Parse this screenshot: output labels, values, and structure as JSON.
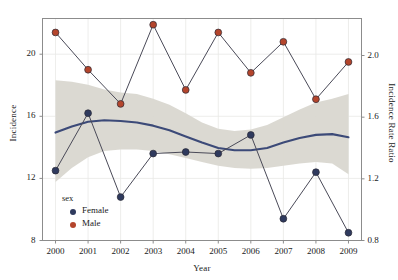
{
  "chart_data": {
    "type": "line",
    "title": "",
    "xlabel": "Year",
    "ylabel": "Incidence",
    "y2label": "Incidence Rate Ratio",
    "x": [
      2000,
      2001,
      2002,
      2003,
      2004,
      2005,
      2006,
      2007,
      2008,
      2009
    ],
    "xtick_labels": [
      "2000",
      "2001",
      "2002",
      "2003",
      "2004",
      "2005",
      "2006",
      "2007",
      "2008",
      "2009"
    ],
    "xlim": [
      1999.6,
      2009.4
    ],
    "ylim": [
      8,
      22.3
    ],
    "ytick_labels": [
      "8",
      "12",
      "16",
      "20"
    ],
    "yticks": [
      8,
      12,
      16,
      20
    ],
    "y2lim": [
      0.8,
      2.24
    ],
    "y2tick_labels": [
      "0.8",
      "1.2",
      "1.6",
      "2.0"
    ],
    "y2ticks": [
      0.8,
      1.2,
      1.6,
      2.0
    ],
    "grid": true,
    "legend_title": "sex",
    "legend_position": "inside-bottom-left",
    "series": [
      {
        "name": "Female",
        "color": "#2f3a5e",
        "axis": "left",
        "values": [
          12.5,
          16.2,
          10.8,
          13.6,
          13.7,
          13.6,
          14.8,
          9.4,
          12.4,
          8.5
        ]
      },
      {
        "name": "Male",
        "color": "#b4452c",
        "axis": "left",
        "values": [
          21.4,
          19.0,
          16.8,
          21.9,
          17.7,
          21.4,
          18.8,
          20.8,
          17.1,
          19.5
        ]
      }
    ],
    "trend": {
      "name": "Incidence Rate Ratio",
      "color": "#3c4a78",
      "axis": "right",
      "band_color": "#d9d7d0",
      "x": [
        2000,
        2000.5,
        2001,
        2001.5,
        2002,
        2002.5,
        2003,
        2003.5,
        2004,
        2004.5,
        2005,
        2005.5,
        2006,
        2006.5,
        2007,
        2007.5,
        2008,
        2008.5,
        2009
      ],
      "fit": [
        1.5,
        1.54,
        1.57,
        1.58,
        1.575,
        1.565,
        1.545,
        1.515,
        1.475,
        1.435,
        1.4,
        1.385,
        1.385,
        1.4,
        1.435,
        1.465,
        1.485,
        1.49,
        1.47
      ],
      "lower": [
        1.18,
        1.27,
        1.34,
        1.38,
        1.39,
        1.39,
        1.38,
        1.36,
        1.335,
        1.31,
        1.285,
        1.27,
        1.265,
        1.27,
        1.285,
        1.3,
        1.31,
        1.3,
        1.23
      ],
      "upper": [
        1.84,
        1.83,
        1.81,
        1.78,
        1.76,
        1.75,
        1.72,
        1.68,
        1.625,
        1.565,
        1.525,
        1.51,
        1.52,
        1.55,
        1.6,
        1.65,
        1.695,
        1.72,
        1.75
      ]
    },
    "legend_entries": [
      {
        "label": "Female",
        "color": "#2f3a5e",
        "marker": "circle"
      },
      {
        "label": "Male",
        "color": "#b4452c",
        "marker": "circle"
      }
    ]
  },
  "axes": {
    "left_title": "Incidence",
    "right_title": "Incidence Rate Ratio",
    "x_title": "Year"
  },
  "legend": {
    "title": "sex",
    "items": [
      {
        "label": "Female"
      },
      {
        "label": "Male"
      }
    ]
  },
  "colors": {
    "female": "#2f3a5e",
    "male": "#b4452c",
    "trend_line": "#3c4a78",
    "confidence_band": "#d9d7d0",
    "frame": "#8c8c8c",
    "grid": "#e8e8e6",
    "text": "#1a1a1a"
  }
}
